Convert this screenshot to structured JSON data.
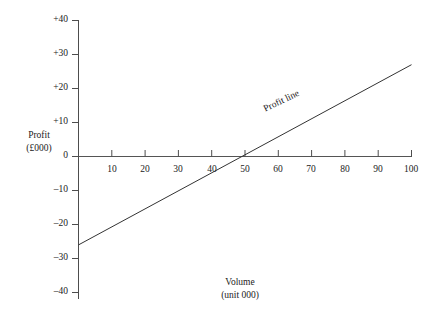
{
  "chart_data": {
    "type": "line",
    "title": "",
    "subtitle": "",
    "xlabel": "Volume",
    "xlabel_units": "(unit 000)",
    "ylabel": "Profit",
    "ylabel_units": "(£000)",
    "xlim": [
      0,
      100
    ],
    "ylim": [
      -40,
      40
    ],
    "xticks": [
      10,
      20,
      30,
      40,
      50,
      60,
      70,
      80,
      90,
      100
    ],
    "xtick_labels": [
      "10",
      "20",
      "30",
      "40",
      "50",
      "60",
      "70",
      "80",
      "90",
      "100"
    ],
    "yticks": [
      40,
      30,
      20,
      10,
      0,
      -10,
      -20,
      -30,
      -40
    ],
    "ytick_labels": [
      "+40",
      "+30",
      "+20",
      "+10",
      "0",
      "–10",
      "–20",
      "–30",
      "–40"
    ],
    "grid": false,
    "legend_position": "inline-annotation",
    "series": [
      {
        "name": "Profit line",
        "x": [
          0,
          100
        ],
        "values": [
          -26,
          27
        ],
        "break_even_volume": 49,
        "color": "#333333"
      }
    ],
    "annotations": [
      {
        "text": "Profit line",
        "x": 70,
        "y": 11,
        "rotation": -25.5
      }
    ]
  },
  "axes": {
    "y_axis_label_line1": "Profit",
    "y_axis_label_line2": "(£000)",
    "x_axis_label_line1": "Volume",
    "x_axis_label_line2": "(unit 000)"
  },
  "colors": {
    "background": "#ffffff",
    "axis": "#4d4d4d",
    "zero_line": "#555555",
    "series": "#333333",
    "text": "#222222"
  }
}
